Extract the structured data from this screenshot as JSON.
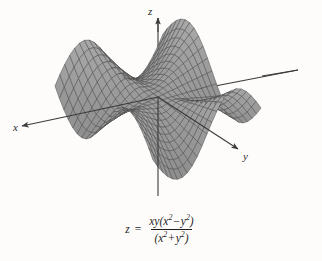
{
  "figure": {
    "type": "3d-surface-plot",
    "background_color": "#fdfcfb",
    "surface_fill": "#a9a9a9",
    "surface_fill_dark": "#8b8b8b",
    "mesh_color": "#4a4a4a",
    "axis_color": "#3a3a3a"
  },
  "axes": {
    "x_label": "x",
    "y_label": "y",
    "z_label": "z"
  },
  "equation": {
    "lhs": "z",
    "equals": "=",
    "numerator": {
      "lead": "xy",
      "open": "(",
      "term1_base": "x",
      "term1_exp": "2",
      "operator": "−",
      "term2_base": "y",
      "term2_exp": "2",
      "close": ")"
    },
    "denominator": {
      "open": "(",
      "term1_base": "x",
      "term1_exp": "2",
      "operator": "+",
      "term2_base": "y",
      "term2_exp": "2",
      "close": ")"
    },
    "plain": "z = xy(x^2 - y^2) / (x^2 + y^2)"
  },
  "chart_data": {
    "type": "surface",
    "title": "",
    "function": "z = xy(x^2 - y^2)/(x^2 + y^2)",
    "xlabel": "x",
    "ylabel": "y",
    "zlabel": "z",
    "xlim": [
      -1,
      1
    ],
    "ylim": [
      -1,
      1
    ],
    "grid_n": 22,
    "projection": {
      "origin_px": [
        158,
        97
      ],
      "x_axis_vec_px": [
        -54,
        26
      ],
      "y_axis_vec_px": [
        49,
        37
      ],
      "z_axis_vec_px": [
        0,
        -68
      ]
    },
    "axis_draw": {
      "x_from": [
        298,
        70
      ],
      "x_to": [
        22,
        126
      ],
      "y_from": [
        96,
        57
      ],
      "y_to": [
        238,
        149
      ],
      "z_from": [
        158,
        196
      ],
      "z_to": [
        158,
        18
      ]
    },
    "legend": "none",
    "grid": false
  }
}
